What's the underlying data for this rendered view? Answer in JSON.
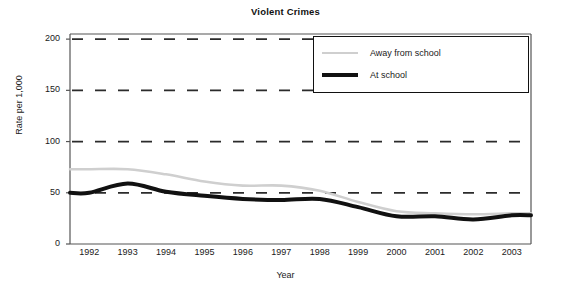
{
  "chart_data": {
    "type": "line",
    "title": "Violent Crimes",
    "xlabel": "Year",
    "ylabel": "Rate per 1,000",
    "categories": [
      "1992",
      "1993",
      "1994",
      "1995",
      "1996",
      "1997",
      "1998",
      "1999",
      "2000",
      "2001",
      "2002",
      "2003"
    ],
    "ytick_labels": [
      "0",
      "50",
      "100",
      "150",
      "200"
    ],
    "ytick_values": [
      0,
      50,
      100,
      150,
      200
    ],
    "ylim": [
      0,
      205
    ],
    "grid": "horizontal-dashed",
    "legend_position": "top-right",
    "series": [
      {
        "name": "Away from school",
        "color": "#cfcfcf",
        "width": 2.6,
        "values": [
          73,
          73,
          68,
          61,
          57,
          57,
          52,
          41,
          32,
          30,
          29,
          30
        ]
      },
      {
        "name": "At school",
        "color": "#111111",
        "width": 4.0,
        "values": [
          50,
          59,
          51,
          47,
          44,
          43,
          44,
          36,
          27,
          27,
          24,
          28
        ]
      }
    ]
  },
  "legend": {
    "items": [
      {
        "label": "Away from school"
      },
      {
        "label": "At school"
      }
    ]
  },
  "axes": {
    "x_title": "Year",
    "y_title": "Rate per 1,000"
  }
}
